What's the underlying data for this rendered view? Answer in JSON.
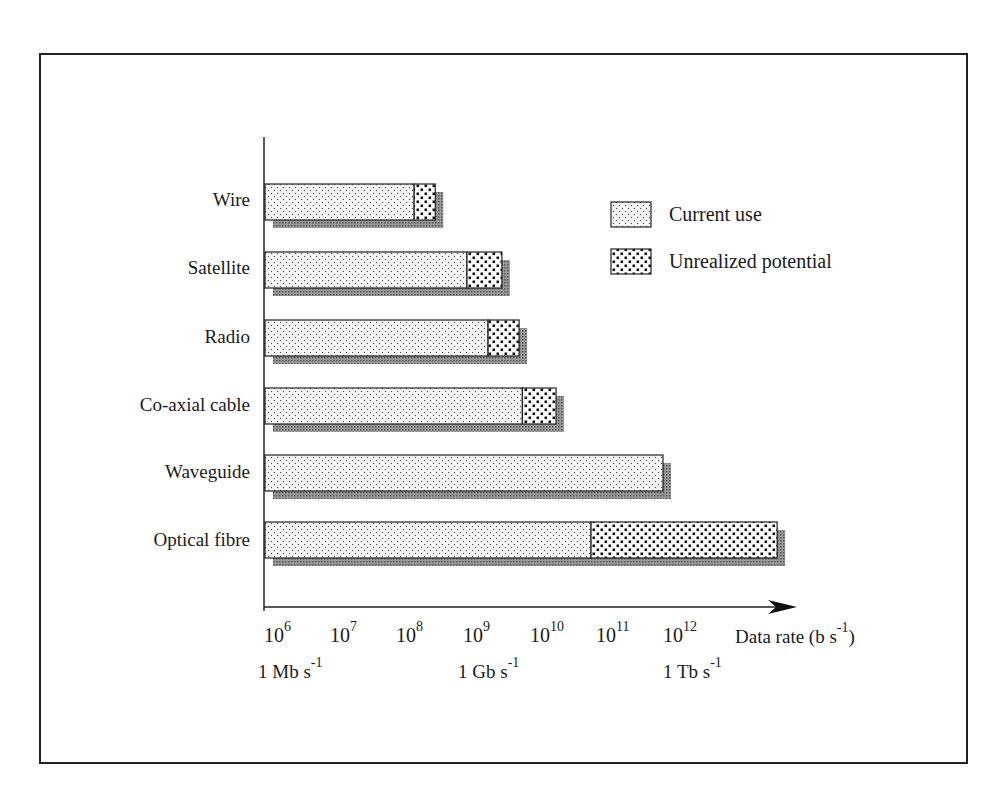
{
  "chart_data": {
    "type": "bar",
    "orientation": "horizontal",
    "stacked": true,
    "scale": "log10",
    "categories": [
      "Wire",
      "Satellite",
      "Radio",
      "Co-axial cable",
      "Waveguide",
      "Optical fibre"
    ],
    "series": [
      {
        "name": "Current use",
        "log10_end": [
          8.26,
          9.06,
          9.38,
          9.9,
          12.03,
          10.94
        ]
      },
      {
        "name": "Unrealized potential",
        "log10_end": [
          8.58,
          9.59,
          9.85,
          10.41,
          null,
          13.76
        ]
      }
    ],
    "x_ticks": [
      "10^6",
      "10^7",
      "10^8",
      "10^9",
      "10^10",
      "10^11",
      "10^12"
    ],
    "x_tick_exponents": [
      6,
      7,
      8,
      9,
      10,
      11,
      12
    ],
    "x_sublabels": [
      {
        "at_exponent": 6,
        "text": "1 Mb s-1"
      },
      {
        "at_exponent": 9,
        "text": "1 Gb s-1"
      },
      {
        "at_exponent": 12,
        "text": "1 Tb s-1"
      }
    ],
    "xlabel": "Data rate (b s-1)",
    "ylabel": "",
    "xlim_log10": [
      6,
      14
    ],
    "grid": false,
    "legend_position": "upper right"
  },
  "labels": {
    "categories": [
      "Wire",
      "Satellite",
      "Radio",
      "Co-axial cable",
      "Waveguide",
      "Optical fibre"
    ],
    "legend_current": "Current use",
    "legend_unrealized": "Unrealized potential",
    "x_tick_base": "10",
    "x_tick_exp": [
      "6",
      "7",
      "8",
      "9",
      "10",
      "11",
      "12"
    ],
    "xlabel_main": "Data rate (b s",
    "xlabel_exp": "-1",
    "xlabel_close": ")",
    "sub_mb": "1 Mb s",
    "sub_gb": "1 Gb s",
    "sub_tb": "1 Tb s",
    "sub_exp": "-1"
  },
  "colors": {
    "outline": "#222222",
    "shadow": "#8a8a8a",
    "current_fill": "#f4f4f4",
    "current_dots": "#555555",
    "unrealized_fill": "#ffffff",
    "unrealized_dots": "#111111"
  }
}
